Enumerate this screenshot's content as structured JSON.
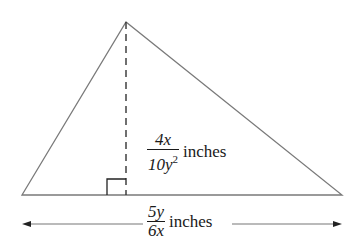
{
  "diagram": {
    "type": "triangle-with-altitude",
    "vertices": {
      "left": [
        22,
        195
      ],
      "right": [
        342,
        195
      ],
      "apex": [
        126,
        22
      ]
    },
    "altitude": {
      "style": "dashed",
      "foot": [
        126,
        195
      ],
      "right_angle_marker": true
    },
    "height_label": {
      "numerator": "4x",
      "denominator_base": "10y",
      "denominator_exponent": "2",
      "unit": "inches"
    },
    "base_label": {
      "numerator": "5y",
      "denominator": "6x",
      "unit": "inches",
      "dimension_arrow": "double-headed"
    },
    "colors": {
      "line": "#777777",
      "text": "#1a1a1a",
      "background": "#ffffff"
    }
  }
}
